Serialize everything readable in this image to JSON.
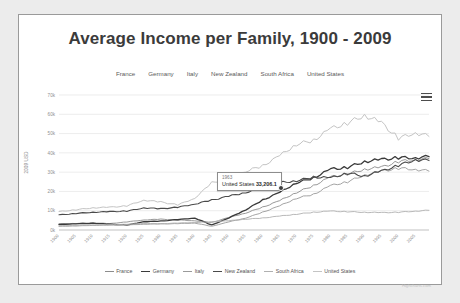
{
  "chart": {
    "title": "Average Income per Family, 1900 - 2009",
    "credit": "Highcharts.com",
    "menu_icon": "hamburger-menu-icon"
  },
  "tooltip": {
    "year": "1963",
    "series": "United States",
    "value": "33,206.1"
  },
  "chart_data": {
    "type": "line",
    "title": "Average Income per Family, 1900 - 2009",
    "xlabel": "",
    "ylabel": "2009 USD",
    "xlim": [
      1900,
      2009
    ],
    "ylim": [
      0,
      70000
    ],
    "grid": true,
    "legend_position": "bottom",
    "ytick_labels": [
      "0k",
      "10k",
      "20k",
      "30k",
      "40k",
      "50k",
      "60k",
      "70k"
    ],
    "ytick_values": [
      0,
      10000,
      20000,
      30000,
      40000,
      50000,
      60000,
      70000
    ],
    "xtick_labels": [
      "1900",
      "1905",
      "1910",
      "1915",
      "1920",
      "1925",
      "1930",
      "1935",
      "1940",
      "1945",
      "1950",
      "1955",
      "1960",
      "1965",
      "1970",
      "1975",
      "1980",
      "1985",
      "1990",
      "1995",
      "2000",
      "2005"
    ],
    "xtick_values": [
      1900,
      1905,
      1910,
      1915,
      1920,
      1925,
      1930,
      1935,
      1940,
      1945,
      1950,
      1955,
      1960,
      1965,
      1970,
      1975,
      1980,
      1985,
      1990,
      1995,
      2000,
      2005
    ],
    "x": [
      1900,
      1905,
      1910,
      1915,
      1920,
      1925,
      1930,
      1935,
      1940,
      1945,
      1950,
      1955,
      1960,
      1965,
      1970,
      1975,
      1980,
      1985,
      1990,
      1995,
      2000,
      2005,
      2009
    ],
    "series": [
      {
        "name": "France",
        "color": "#8c8c8c",
        "width": 0.9,
        "values": [
          3100,
          3400,
          3700,
          3300,
          4200,
          5200,
          5600,
          5200,
          4800,
          3900,
          6500,
          8800,
          11800,
          15200,
          19500,
          23000,
          27500,
          29000,
          31500,
          32500,
          35500,
          36500,
          37000
        ]
      },
      {
        "name": "Germany",
        "color": "#3a3a3a",
        "width": 1.3,
        "values": [
          2900,
          3200,
          3500,
          3000,
          2600,
          4300,
          4600,
          5400,
          6200,
          2600,
          6200,
          10500,
          15500,
          19500,
          24500,
          27000,
          31500,
          32500,
          35500,
          36500,
          37500,
          37500,
          38000
        ]
      },
      {
        "name": "Italy",
        "color": "#9a9a9a",
        "width": 0.9,
        "values": [
          1900,
          2100,
          2400,
          2500,
          2600,
          3000,
          3100,
          3300,
          3600,
          1900,
          4200,
          6200,
          9200,
          12500,
          16500,
          18500,
          23000,
          25000,
          28500,
          30500,
          32000,
          31500,
          30500
        ]
      },
      {
        "name": "New Zealand",
        "color": "#4a4a4a",
        "width": 1.1,
        "values": [
          7800,
          8600,
          9200,
          9500,
          9800,
          11500,
          11000,
          11800,
          13500,
          15500,
          17500,
          19500,
          21500,
          24500,
          25500,
          27500,
          27000,
          29500,
          28000,
          30500,
          33500,
          36500,
          36000
        ]
      },
      {
        "name": "South Africa",
        "color": "#b0b0b0",
        "width": 0.9,
        "values": [
          2200,
          2400,
          2600,
          2700,
          3000,
          3400,
          3300,
          3600,
          3900,
          4200,
          4800,
          5600,
          6200,
          7200,
          8200,
          9200,
          9800,
          9500,
          9200,
          9000,
          9200,
          9800,
          10200
        ]
      },
      {
        "name": "United States",
        "color": "#c4c4c4",
        "width": 1.0,
        "values": [
          9500,
          10500,
          11500,
          11800,
          12500,
          15500,
          14500,
          13000,
          16500,
          24500,
          26500,
          30500,
          33206,
          38500,
          44500,
          46500,
          52500,
          55500,
          59500,
          55500,
          47500,
          50500,
          48500
        ]
      }
    ]
  },
  "series_toggles": [
    {
      "label": "France"
    },
    {
      "label": "Germany"
    },
    {
      "label": "Italy"
    },
    {
      "label": "New Zealand"
    },
    {
      "label": "South Africa"
    },
    {
      "label": "United States"
    }
  ],
  "legend": [
    {
      "label": "France",
      "color": "#8c8c8c",
      "width": 0.9
    },
    {
      "label": "Germany",
      "color": "#3a3a3a",
      "width": 1.6
    },
    {
      "label": "Italy",
      "color": "#9a9a9a",
      "width": 0.9
    },
    {
      "label": "New Zealand",
      "color": "#4a4a4a",
      "width": 1.4
    },
    {
      "label": "South Africa",
      "color": "#b0b0b0",
      "width": 0.9
    },
    {
      "label": "United States",
      "color": "#c4c4c4",
      "width": 1.2
    }
  ]
}
